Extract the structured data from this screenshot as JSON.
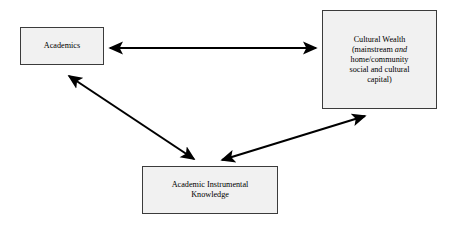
{
  "diagram": {
    "background_color": "#ffffff",
    "box_fill_color": "#f1f1f1",
    "box_border_color": "#3b3b3b",
    "arrow_color": "#000000",
    "nodes": [
      {
        "id": "academics",
        "label": "Academics"
      },
      {
        "id": "cultural-wealth",
        "label": "Cultural Wealth (mainstream and home/community social and cultural capital)",
        "lines": [
          "Cultural Wealth",
          "(mainstream ",
          "home/community",
          "social and cultural",
          "capital)"
        ],
        "line1": "Cultural Wealth",
        "line2_pre": "(mainstream",
        "line2_italic": "and",
        "line3": "home/community",
        "line4": "social and cultural",
        "line5": "capital)"
      },
      {
        "id": "academic-instrumental-knowledge",
        "label": "Academic Instrumental Knowledge",
        "line1": "Academic Instrumental",
        "line2": "Knowledge"
      }
    ],
    "connectors": [
      {
        "id": "academics-cultural-wealth",
        "from": "academics",
        "to": "cultural-wealth",
        "style": "double-headed",
        "orientation": "horizontal"
      },
      {
        "id": "academics-academic-instrumental-knowledge",
        "from": "academics",
        "to": "academic-instrumental-knowledge",
        "style": "double-headed",
        "orientation": "diagonal-left"
      },
      {
        "id": "cultural-wealth-academic-instrumental-knowledge",
        "from": "cultural-wealth",
        "to": "academic-instrumental-knowledge",
        "style": "double-headed",
        "orientation": "diagonal-right"
      }
    ]
  }
}
